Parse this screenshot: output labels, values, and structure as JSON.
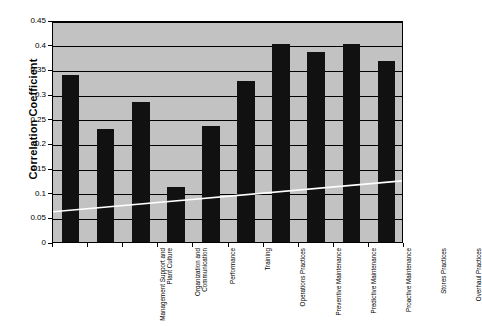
{
  "chart_data": {
    "type": "bar",
    "title": "",
    "xlabel": "",
    "ylabel": "Correlation Coefficient",
    "ylim": [
      0,
      0.45
    ],
    "ytick_step": 0.05,
    "ytick_labels": [
      "0",
      "0.05",
      "0.1",
      "0.15",
      "0.2",
      "0.25",
      "0.3",
      "0.35",
      "0.4",
      "0.45"
    ],
    "ytick_values": [
      0,
      0.05,
      0.1,
      0.15,
      0.2,
      0.25,
      0.3,
      0.35,
      0.4,
      0.45
    ],
    "grid": true,
    "legend": "none",
    "categories": [
      "Management Support and Plant Culture",
      "Organization and Communication",
      "Performance",
      "Training",
      "Operations Practices",
      "Preventive Maintenance",
      "Predictive Maintenance",
      "Proactive Maintenance",
      "Stores Practices",
      "Overhaul Practices"
    ],
    "values": [
      0.338,
      0.229,
      0.284,
      0.111,
      0.236,
      0.327,
      0.402,
      0.385,
      0.401,
      0.367
    ],
    "series": [
      {
        "name": "Correlation Coefficient",
        "type": "bar",
        "color": "#111111",
        "values": [
          0.338,
          0.229,
          0.284,
          0.111,
          0.236,
          0.327,
          0.402,
          0.385,
          0.401,
          0.367
        ]
      },
      {
        "name": "Trend",
        "type": "line",
        "color": "#ffffff",
        "values": [
          0.062,
          0.069,
          0.076,
          0.083,
          0.09,
          0.097,
          0.104,
          0.111,
          0.118,
          0.125
        ]
      }
    ],
    "colors": {
      "plot_background": "#c2c2c2",
      "bar": "#111111",
      "trend_line": "#ffffff",
      "gridline": "#000000",
      "axis": "#000000",
      "page_background": "#ffffff"
    }
  }
}
